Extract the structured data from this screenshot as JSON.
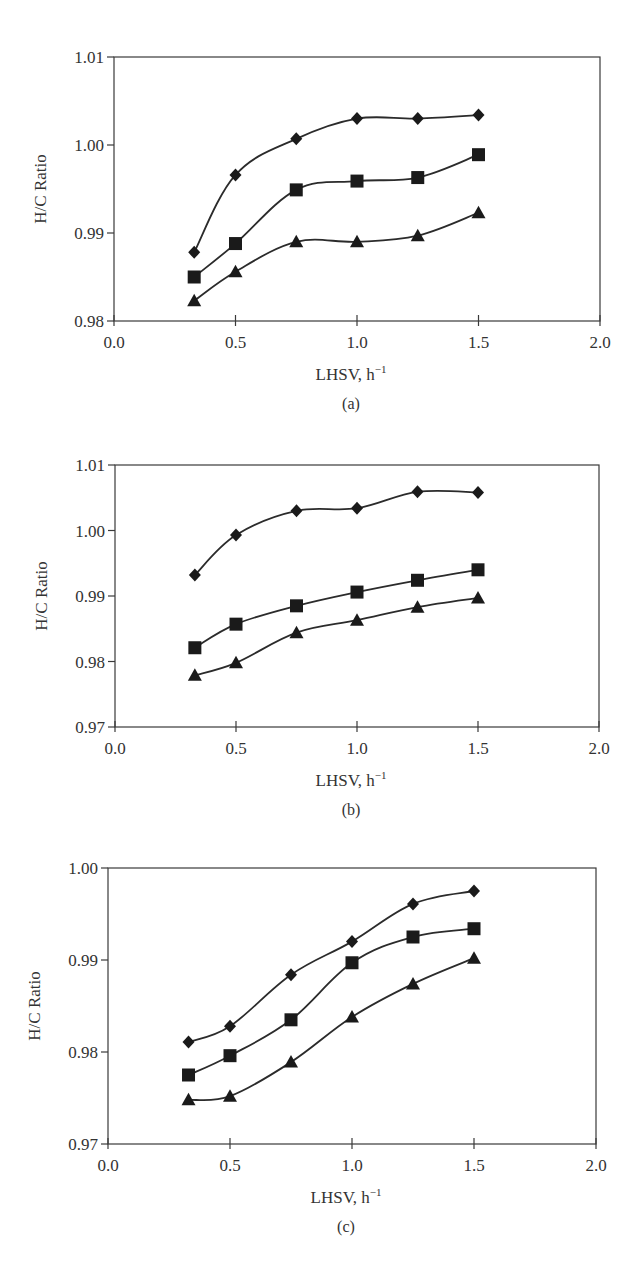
{
  "chart_data": [
    {
      "type": "line",
      "panel": "(a)",
      "caption": "(a)",
      "title": "",
      "xlabel": "LHSV, h",
      "xlabel_sup": "−1",
      "ylabel": "H/C Ratio",
      "xlim": [
        0.0,
        2.0
      ],
      "ylim": [
        0.98,
        1.01
      ],
      "xticks": [
        "0.0",
        "0.5",
        "1.0",
        "1.5",
        "2.0"
      ],
      "yticks": [
        "0.98",
        "0.99",
        "1.00",
        "1.01"
      ],
      "grid": false,
      "legend": "none",
      "x": [
        0.33,
        0.5,
        0.75,
        1.0,
        1.25,
        1.5
      ],
      "series": [
        {
          "name": "diamond",
          "marker": "diamond",
          "values": [
            0.9878,
            0.9966,
            1.0007,
            1.003,
            1.003,
            1.0034
          ]
        },
        {
          "name": "square",
          "marker": "square",
          "values": [
            0.985,
            0.9888,
            0.9949,
            0.9959,
            0.9963,
            0.9989
          ]
        },
        {
          "name": "triangle",
          "marker": "triangle",
          "values": [
            0.9823,
            0.9856,
            0.989,
            0.989,
            0.9897,
            0.9923
          ]
        }
      ]
    },
    {
      "type": "line",
      "panel": "(b)",
      "caption": "(b)",
      "title": "",
      "xlabel": "LHSV, h",
      "xlabel_sup": "−1",
      "ylabel": "H/C Ratio",
      "xlim": [
        0.0,
        2.0
      ],
      "ylim": [
        0.97,
        1.01
      ],
      "xticks": [
        "0.0",
        "0.5",
        "1.0",
        "1.5",
        "2.0"
      ],
      "yticks": [
        "0.97",
        "0.98",
        "0.99",
        "1.00",
        "1.01"
      ],
      "grid": false,
      "legend": "none",
      "x": [
        0.33,
        0.5,
        0.75,
        1.0,
        1.25,
        1.5
      ],
      "series": [
        {
          "name": "diamond",
          "marker": "diamond",
          "values": [
            0.9932,
            0.9993,
            1.003,
            1.0034,
            1.0059,
            1.0058
          ]
        },
        {
          "name": "square",
          "marker": "square",
          "values": [
            0.9821,
            0.9857,
            0.9885,
            0.9906,
            0.9924,
            0.994
          ]
        },
        {
          "name": "triangle",
          "marker": "triangle",
          "values": [
            0.9779,
            0.9798,
            0.9844,
            0.9863,
            0.9883,
            0.9897
          ]
        }
      ]
    },
    {
      "type": "line",
      "panel": "(c)",
      "caption": "(c)",
      "title": "",
      "xlabel": "LHSV, h",
      "xlabel_sup": "−1",
      "ylabel": "H/C Ratio",
      "xlim": [
        0.0,
        2.0
      ],
      "ylim": [
        0.97,
        1.0
      ],
      "xticks": [
        "0.0",
        "0.5",
        "1.0",
        "1.5",
        "2.0"
      ],
      "yticks": [
        "0.97",
        "0.98",
        "0.99",
        "1.00"
      ],
      "grid": false,
      "legend": "none",
      "x": [
        0.33,
        0.5,
        0.75,
        1.0,
        1.25,
        1.5
      ],
      "series": [
        {
          "name": "diamond",
          "marker": "diamond",
          "values": [
            0.9811,
            0.9828,
            0.9884,
            0.992,
            0.9961,
            0.9975
          ]
        },
        {
          "name": "square",
          "marker": "square",
          "values": [
            0.9775,
            0.9796,
            0.9835,
            0.9897,
            0.9925,
            0.9934
          ]
        },
        {
          "name": "triangle",
          "marker": "triangle",
          "values": [
            0.9748,
            0.9752,
            0.9789,
            0.9838,
            0.9874,
            0.9902
          ]
        }
      ]
    }
  ],
  "style": {
    "line_color": "#2b2b2b",
    "marker_color": "#1a1a1a",
    "axis_color": "#3a3a3a",
    "text_color": "#333333"
  }
}
